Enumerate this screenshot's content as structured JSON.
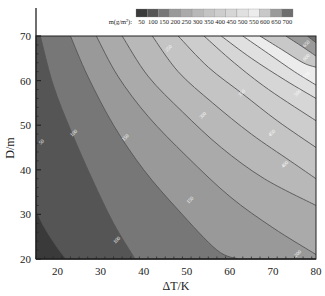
{
  "chart_data": {
    "type": "contour",
    "title": "",
    "xlabel": "ΔT/K",
    "ylabel": "D/m",
    "xlim": [
      15,
      80
    ],
    "ylim": [
      20,
      70
    ],
    "xticks": [
      20,
      30,
      40,
      50,
      60,
      70,
      80
    ],
    "yticks": [
      20,
      30,
      40,
      50,
      60,
      70
    ],
    "grid": false,
    "legend": {
      "title": "m(g/m²):",
      "position": "top",
      "levels": [
        50,
        100,
        150,
        200,
        250,
        300,
        350,
        400,
        450,
        500,
        550,
        600,
        650,
        700
      ],
      "colors": [
        "#3a3a3a",
        "#555555",
        "#777777",
        "#999999",
        "#aaaaaa",
        "#b8b8b8",
        "#c4c4c4",
        "#cdcdcd",
        "#d6d6d6",
        "#e0e0e0",
        "#ececec",
        "#c8c8c8",
        "#9a9a9a",
        "#6e6e6e"
      ]
    },
    "contours": [
      {
        "level": 50,
        "points": [
          [
            15,
            31
          ],
          [
            17,
            27
          ],
          [
            20,
            22.5
          ],
          [
            22,
            20
          ]
        ]
      },
      {
        "level": 100,
        "points": [
          [
            16,
            70
          ],
          [
            19,
            59
          ],
          [
            23,
            49
          ],
          [
            28,
            38
          ],
          [
            33,
            28
          ],
          [
            38,
            20
          ]
        ]
      },
      {
        "level": 150,
        "points": [
          [
            23,
            70
          ],
          [
            27,
            61
          ],
          [
            33,
            50
          ],
          [
            40,
            40
          ],
          [
            48,
            31
          ],
          [
            57,
            22
          ],
          [
            62,
            20
          ]
        ]
      },
      {
        "level": 200,
        "points": [
          [
            29,
            70
          ],
          [
            34,
            61
          ],
          [
            41,
            52
          ],
          [
            50,
            43
          ],
          [
            60,
            34
          ],
          [
            70,
            27
          ],
          [
            80,
            21
          ]
        ]
      },
      {
        "level": 250,
        "points": [
          [
            35,
            70
          ],
          [
            41,
            61
          ],
          [
            49,
            53
          ],
          [
            58,
            45
          ],
          [
            68,
            38
          ],
          [
            80,
            32
          ]
        ]
      },
      {
        "level": 300,
        "points": [
          [
            42,
            70
          ],
          [
            48,
            62
          ],
          [
            56,
            55
          ],
          [
            65,
            48
          ],
          [
            74,
            42
          ],
          [
            80,
            38
          ]
        ]
      },
      {
        "level": 350,
        "points": [
          [
            48,
            70
          ],
          [
            55,
            63
          ],
          [
            63,
            57
          ],
          [
            71,
            51
          ],
          [
            80,
            45
          ]
        ]
      },
      {
        "level": 400,
        "points": [
          [
            54,
            70
          ],
          [
            61,
            64
          ],
          [
            69,
            58
          ],
          [
            80,
            51
          ]
        ]
      },
      {
        "level": 450,
        "points": [
          [
            58,
            70
          ],
          [
            65,
            65
          ],
          [
            73,
            60
          ],
          [
            80,
            56
          ]
        ]
      },
      {
        "level": 500,
        "points": [
          [
            63,
            70
          ],
          [
            69,
            66
          ],
          [
            75,
            62
          ],
          [
            80,
            59
          ]
        ]
      },
      {
        "level": 550,
        "points": [
          [
            67,
            70
          ],
          [
            72,
            67
          ],
          [
            77,
            64
          ],
          [
            80,
            63
          ]
        ]
      },
      {
        "level": 600,
        "points": [
          [
            73,
            70
          ],
          [
            77,
            67.5
          ],
          [
            80,
            65.5
          ]
        ]
      },
      {
        "level": 650,
        "points": [
          [
            78,
            70
          ],
          [
            80,
            68.5
          ]
        ]
      }
    ],
    "contour_labels": [
      {
        "text": "50",
        "x": 16.5,
        "y": 46
      },
      {
        "text": "100",
        "x": 24,
        "y": 48
      },
      {
        "text": "100",
        "x": 34,
        "y": 24
      },
      {
        "text": "150",
        "x": 36,
        "y": 47
      },
      {
        "text": "150",
        "x": 51,
        "y": 33
      },
      {
        "text": "250",
        "x": 46,
        "y": 67
      },
      {
        "text": "300",
        "x": 54,
        "y": 52
      },
      {
        "text": "350",
        "x": 63,
        "y": 57
      },
      {
        "text": "400",
        "x": 73,
        "y": 41
      },
      {
        "text": "450",
        "x": 70,
        "y": 48
      },
      {
        "text": "500",
        "x": 76,
        "y": 57
      },
      {
        "text": "550",
        "x": 78,
        "y": 61
      },
      {
        "text": "600",
        "x": 78,
        "y": 65
      },
      {
        "text": "650",
        "x": 78,
        "y": 68
      },
      {
        "text": "200",
        "x": 76,
        "y": 21
      }
    ]
  }
}
